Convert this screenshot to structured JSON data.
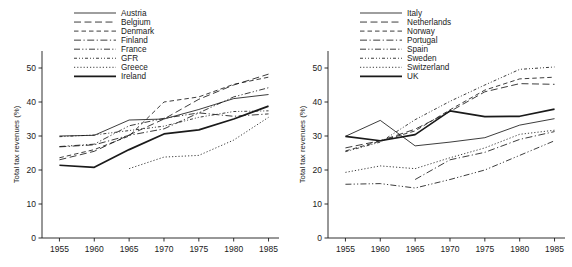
{
  "figure": {
    "panel_count": 2,
    "line_color": "#1a1a1a",
    "background": "#ffffff"
  },
  "chart_data": [
    {
      "type": "line",
      "panel": "left",
      "title": "",
      "xlabel": "",
      "ylabel": "Total tax revenues (%)",
      "x": [
        1955,
        1960,
        1965,
        1970,
        1975,
        1980,
        1985
      ],
      "xticks": [
        "1955",
        "1960",
        "1965",
        "1970",
        "1975",
        "1980",
        "1985"
      ],
      "yticks": [
        "0",
        "10",
        "20",
        "30",
        "40",
        "50"
      ],
      "xlim": [
        1952.5,
        1986.5
      ],
      "ylim": [
        0,
        55
      ],
      "grid": false,
      "legend_position": "top-center",
      "series": [
        {
          "name": "Austria",
          "dash": "solid",
          "width": "thin",
          "values": [
            30.0,
            30.2,
            34.7,
            35.0,
            37.8,
            41.0,
            42.2
          ]
        },
        {
          "name": "Belgium",
          "dash": "long-dash",
          "width": "thin",
          "values": [
            23.0,
            25.5,
            30.3,
            35.0,
            40.8,
            45.0,
            48.2
          ]
        },
        {
          "name": "Denmark",
          "dash": "dash",
          "width": "thin",
          "values": [
            23.6,
            26.0,
            30.0,
            40.0,
            41.5,
            45.2,
            47.3
          ]
        },
        {
          "name": "Finland",
          "dash": "dash-dot",
          "width": "thin",
          "values": [
            26.8,
            27.4,
            30.2,
            32.1,
            36.8,
            35.8,
            36.5
          ]
        },
        {
          "name": "France",
          "dash": "dash-dot-dot",
          "width": "thin",
          "values": [
            26.9,
            27.6,
            33.0,
            35.2,
            36.8,
            41.5,
            44.2
          ]
        },
        {
          "name": "GFR",
          "dash": "dash-dot-dot-fine",
          "width": "thin",
          "values": [
            29.8,
            30.3,
            31.6,
            32.9,
            35.5,
            37.2,
            37.4
          ]
        },
        {
          "name": "Greece",
          "dash": "dot",
          "width": "thin",
          "values": [
            null,
            null,
            20.4,
            23.8,
            24.3,
            28.8,
            35.5
          ]
        },
        {
          "name": "Ireland",
          "dash": "solid",
          "width": "thick",
          "values": [
            21.4,
            20.8,
            26.0,
            30.6,
            31.8,
            35.0,
            38.8
          ]
        }
      ]
    },
    {
      "type": "line",
      "panel": "right",
      "title": "",
      "xlabel": "",
      "ylabel": "Total tax revenues (%)",
      "x": [
        1955,
        1960,
        1965,
        1970,
        1975,
        1980,
        1985
      ],
      "xticks": [
        "1955",
        "1960",
        "1965",
        "1970",
        "1975",
        "1980",
        "1985"
      ],
      "yticks": [
        "0",
        "10",
        "20",
        "30",
        "40",
        "50"
      ],
      "xlim": [
        1952.5,
        1986.5
      ],
      "ylim": [
        0,
        55
      ],
      "grid": false,
      "legend_position": "top-center",
      "series": [
        {
          "name": "Italy",
          "dash": "solid",
          "width": "thin",
          "values": [
            29.9,
            34.6,
            27.1,
            28.2,
            29.5,
            33.2,
            35.1
          ]
        },
        {
          "name": "Netherlands",
          "dash": "long-dash",
          "width": "thin",
          "values": [
            26.5,
            28.6,
            32.0,
            37.2,
            43.0,
            45.4,
            45.2
          ]
        },
        {
          "name": "Norway",
          "dash": "dash",
          "width": "thin",
          "values": [
            25.6,
            28.5,
            31.5,
            37.7,
            43.5,
            46.8,
            47.3
          ]
        },
        {
          "name": "Portugal",
          "dash": "dash-dot",
          "width": "thin",
          "values": [
            null,
            null,
            17.2,
            23.0,
            25.2,
            29.0,
            31.3
          ]
        },
        {
          "name": "Spain",
          "dash": "dash-dot-dot",
          "width": "thin",
          "values": [
            15.8,
            16.0,
            14.7,
            17.2,
            20.0,
            24.3,
            28.6
          ]
        },
        {
          "name": "Sweden",
          "dash": "dash-dot-dot-fine",
          "width": "thin",
          "values": [
            25.4,
            28.2,
            34.8,
            40.2,
            45.0,
            49.6,
            50.3
          ]
        },
        {
          "name": "Switzerland",
          "dash": "dot",
          "width": "thin",
          "values": [
            19.3,
            21.2,
            20.4,
            23.6,
            26.5,
            30.5,
            31.7
          ]
        },
        {
          "name": "UK",
          "dash": "solid",
          "width": "thick",
          "values": [
            29.9,
            28.6,
            30.4,
            37.4,
            35.7,
            35.8,
            37.9
          ]
        }
      ]
    }
  ]
}
